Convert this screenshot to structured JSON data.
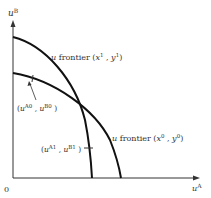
{
  "diagram": {
    "type": "utility-possibility-frontiers",
    "axes": {
      "y_label": "u",
      "y_label_sup": "B",
      "x_label": "u",
      "x_label_sup": "A",
      "origin_label": "0"
    },
    "curves": [
      {
        "name": "frontier-x1-y1",
        "label_u": "u",
        "label_text": " frontier (",
        "label_x": "x",
        "sup1": "1",
        "sep": " , ",
        "label_y": "y",
        "sup2": "1",
        "close": ")"
      },
      {
        "name": "frontier-x0-y0",
        "label_u": "u",
        "label_text": " frontier (",
        "label_x": "x",
        "sup1": "0",
        "sep": " , ",
        "label_y": "y",
        "sup2": "0",
        "close": ")"
      }
    ],
    "points": [
      {
        "name": "point-A0-B0",
        "open": "(",
        "u1": "u",
        "s1": "A0",
        "sep": " , ",
        "u2": "u",
        "s2": "B0",
        "close": " )"
      },
      {
        "name": "point-A1-B1",
        "open": "(",
        "u1": "u",
        "s1": "A1",
        "sep": " , ",
        "u2": "u",
        "s2": "B1",
        "close": " )"
      }
    ],
    "colors": {
      "line": "#111111",
      "text": "#333333"
    }
  }
}
